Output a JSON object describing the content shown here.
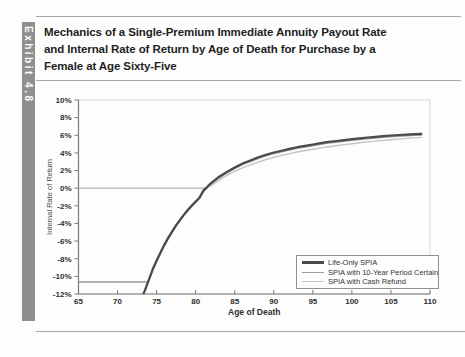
{
  "exhibit": {
    "label": "Exhibit 4.8"
  },
  "title": {
    "lines": [
      "Mechanics of a Single-Premium Immediate Annuity Payout Rate",
      "and Internal Rate of Return by Age of Death for Purchase by a",
      "Female at Age Sixty-Five"
    ]
  },
  "colors": {
    "sidebar_bg": "#8f8f8f",
    "sidebar_text": "#ffffff",
    "title_text": "#1f1f1f",
    "rule": "#a8a8a8",
    "axis": "#7a7a7a",
    "frame": "#d8d8d8",
    "tick_text": "#2e2e2e",
    "series_life_only": "#4a4a4a",
    "series_period_certain": "#9c9c9c",
    "series_cash_refund": "#c4c4c4"
  },
  "chart_data": {
    "type": "line",
    "title": "",
    "xlabel": "Age of Death",
    "ylabel": "Internal Rate of Return",
    "xlim": [
      65,
      110
    ],
    "ylim": [
      -12,
      10
    ],
    "grid": false,
    "legend_position": "bottom-right",
    "x_ticks": [
      65,
      70,
      75,
      80,
      85,
      90,
      95,
      100,
      105,
      110
    ],
    "y_ticks": [
      {
        "v": 10,
        "label": "10%"
      },
      {
        "v": 8,
        "label": "8%"
      },
      {
        "v": 6,
        "label": "6%"
      },
      {
        "v": 4,
        "label": "4%"
      },
      {
        "v": 2,
        "label": "2%"
      },
      {
        "v": 0,
        "label": "0%"
      },
      {
        "v": -2,
        "label": "-2%"
      },
      {
        "v": -4,
        "label": "-4%"
      },
      {
        "v": -6,
        "label": "-6%"
      },
      {
        "v": -8,
        "label": "-8%"
      },
      {
        "v": -10,
        "label": "-10%"
      },
      {
        "v": -12,
        "label": "-12%"
      }
    ],
    "series": [
      {
        "name": "Life-Only SPIA",
        "color_key": "series_life_only",
        "stroke_width": 2.2,
        "points": [
          [
            72.6,
            -14.5
          ],
          [
            73,
            -13.2
          ],
          [
            73.3,
            -12
          ],
          [
            73.5,
            -11.6
          ],
          [
            74,
            -10.4
          ],
          [
            74.5,
            -9.2
          ],
          [
            75,
            -8.2
          ],
          [
            75.5,
            -7.3
          ],
          [
            76,
            -6.4
          ],
          [
            76.5,
            -5.6
          ],
          [
            77,
            -4.9
          ],
          [
            77.5,
            -4.2
          ],
          [
            78,
            -3.6
          ],
          [
            78.5,
            -3.0
          ],
          [
            79,
            -2.45
          ],
          [
            79.5,
            -1.95
          ],
          [
            80,
            -1.5
          ],
          [
            80.5,
            -1.05
          ],
          [
            81,
            -0.25
          ],
          [
            81.3,
            0
          ],
          [
            82,
            0.6
          ],
          [
            82.5,
            0.95
          ],
          [
            83,
            1.3
          ],
          [
            84,
            1.85
          ],
          [
            85,
            2.35
          ],
          [
            86,
            2.8
          ],
          [
            87,
            3.15
          ],
          [
            88,
            3.5
          ],
          [
            89,
            3.8
          ],
          [
            90,
            4.05
          ],
          [
            91,
            4.25
          ],
          [
            92,
            4.45
          ],
          [
            93,
            4.65
          ],
          [
            94,
            4.8
          ],
          [
            95,
            4.95
          ],
          [
            96,
            5.1
          ],
          [
            97,
            5.25
          ],
          [
            98,
            5.35
          ],
          [
            99,
            5.45
          ],
          [
            100,
            5.55
          ],
          [
            101,
            5.65
          ],
          [
            102,
            5.75
          ],
          [
            103,
            5.82
          ],
          [
            104,
            5.9
          ],
          [
            105,
            5.97
          ],
          [
            106,
            6.03
          ],
          [
            107,
            6.08
          ],
          [
            108,
            6.13
          ],
          [
            109,
            6.17
          ]
        ]
      },
      {
        "name": "SPIA with 10-Year Period Certain",
        "color_key": "series_period_certain",
        "stroke_width": 1.4,
        "points": [
          [
            65,
            -10.5
          ],
          [
            70,
            -10.5
          ],
          [
            73.8,
            -10.5
          ],
          [
            74,
            -10.4
          ],
          [
            74.5,
            -9.2
          ],
          [
            75,
            -8.2
          ],
          [
            75.5,
            -7.3
          ],
          [
            76,
            -6.4
          ],
          [
            76.5,
            -5.6
          ],
          [
            77,
            -4.9
          ],
          [
            77.5,
            -4.2
          ],
          [
            78,
            -3.6
          ],
          [
            78.5,
            -3.0
          ],
          [
            79,
            -2.45
          ],
          [
            79.5,
            -1.95
          ],
          [
            80,
            -1.5
          ],
          [
            80.5,
            -1.05
          ],
          [
            81,
            -0.25
          ],
          [
            81.3,
            0
          ],
          [
            82,
            0.6
          ],
          [
            82.5,
            0.95
          ],
          [
            83,
            1.3
          ],
          [
            84,
            1.85
          ],
          [
            85,
            2.35
          ],
          [
            86,
            2.8
          ],
          [
            87,
            3.15
          ],
          [
            88,
            3.5
          ],
          [
            89,
            3.8
          ],
          [
            90,
            4.05
          ],
          [
            91,
            4.25
          ],
          [
            92,
            4.45
          ],
          [
            93,
            4.65
          ],
          [
            94,
            4.8
          ],
          [
            95,
            4.95
          ],
          [
            96,
            5.1
          ],
          [
            97,
            5.25
          ],
          [
            98,
            5.35
          ],
          [
            99,
            5.45
          ],
          [
            100,
            5.55
          ],
          [
            101,
            5.65
          ],
          [
            102,
            5.75
          ],
          [
            103,
            5.82
          ],
          [
            104,
            5.9
          ],
          [
            105,
            5.97
          ],
          [
            106,
            6.03
          ],
          [
            107,
            6.08
          ],
          [
            108,
            6.13
          ],
          [
            109,
            6.17
          ]
        ]
      },
      {
        "name": "SPIA with Cash Refund",
        "color_key": "series_cash_refund",
        "stroke_width": 1.4,
        "points": [
          [
            65,
            0
          ],
          [
            70,
            0
          ],
          [
            75,
            0
          ],
          [
            80,
            0
          ],
          [
            81.3,
            0
          ],
          [
            82,
            0.3
          ],
          [
            82.5,
            0.6
          ],
          [
            83,
            0.9
          ],
          [
            84,
            1.45
          ],
          [
            85,
            1.9
          ],
          [
            86,
            2.3
          ],
          [
            87,
            2.65
          ],
          [
            88,
            2.95
          ],
          [
            89,
            3.25
          ],
          [
            90,
            3.5
          ],
          [
            91,
            3.72
          ],
          [
            92,
            3.92
          ],
          [
            93,
            4.1
          ],
          [
            94,
            4.27
          ],
          [
            95,
            4.42
          ],
          [
            96,
            4.57
          ],
          [
            97,
            4.7
          ],
          [
            98,
            4.82
          ],
          [
            99,
            4.94
          ],
          [
            100,
            5.05
          ],
          [
            101,
            5.15
          ],
          [
            102,
            5.25
          ],
          [
            103,
            5.34
          ],
          [
            104,
            5.42
          ],
          [
            105,
            5.5
          ],
          [
            106,
            5.57
          ],
          [
            107,
            5.64
          ],
          [
            108,
            5.7
          ],
          [
            109,
            5.76
          ]
        ]
      }
    ],
    "legend_items": [
      "Life-Only SPIA",
      "SPIA with 10-Year Period Certain",
      "SPIA with Cash Refund"
    ]
  }
}
